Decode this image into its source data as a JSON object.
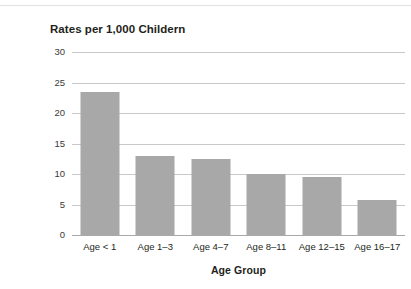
{
  "page": {
    "background_color": "#ffffff",
    "rule_color": "#e2e2e2"
  },
  "chart_data": {
    "type": "bar",
    "title": "Rates per 1,000 Childern",
    "xlabel": "Age Group",
    "ylabel": "",
    "categories": [
      "Age < 1",
      "Age 1–3",
      "Age 4–7",
      "Age 8–11",
      "Age 12–15",
      "Age 16–17"
    ],
    "values": [
      23.5,
      13,
      12.5,
      10,
      9.5,
      5.8
    ],
    "ylim": [
      0,
      30
    ],
    "yticks": [
      0,
      5,
      10,
      15,
      20,
      25,
      30
    ],
    "ytick_labels": [
      "0",
      "5",
      "10",
      "15",
      "20",
      "25",
      "30"
    ],
    "grid": true,
    "grid_axis": "y",
    "legend": false,
    "bar_color": "#a8a8a8",
    "gridline_color": "#c9c9c9",
    "axis_color": "#a9a9a9"
  }
}
